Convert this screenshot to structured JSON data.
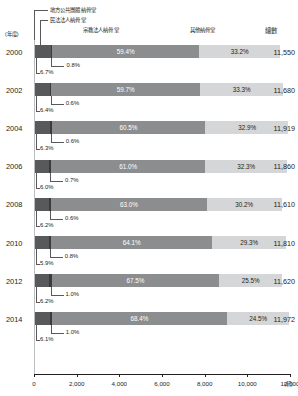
{
  "axis": {
    "year_axis_label": "(年度)",
    "unit_label": "(軒)",
    "x_ticks": [
      "0",
      "2,000",
      "4,000",
      "6,000",
      "8,000",
      "10,000",
      "12,000"
    ],
    "x_min": 0,
    "x_max": 12000
  },
  "legend": [
    {
      "label": "地方公共團體納骨堂",
      "color": "#58595b",
      "key": "local-government"
    },
    {
      "label": "民法法人納骨堂",
      "color": "#3b3b3d",
      "key": "civil-law-corporation"
    },
    {
      "label": "宗教法人納骨堂",
      "color": "#8c8d8f",
      "key": "religious-corporation"
    },
    {
      "label": "其他納骨堂",
      "color": "#d5d6d8",
      "key": "other"
    }
  ],
  "headers": {
    "total": "總數"
  },
  "chart_data": {
    "type": "bar",
    "title": "",
    "xlabel": "(軒)",
    "ylabel": "(年度)",
    "xlim": [
      0,
      12000
    ],
    "orientation": "horizontal",
    "stacked": true,
    "stack_mode": "percent-of-total",
    "grid": false,
    "legend_position": "top",
    "categories": [
      "2000",
      "2002",
      "2004",
      "2006",
      "2008",
      "2010",
      "2012",
      "2014"
    ],
    "series": [
      {
        "name": "地方公共團體納骨堂",
        "values": [
          6.7,
          6.4,
          6.3,
          6.0,
          6.2,
          5.9,
          6.2,
          6.1
        ]
      },
      {
        "name": "民法法人納骨堂",
        "values": [
          0.8,
          0.6,
          0.6,
          0.7,
          0.6,
          0.8,
          1.0,
          1.0
        ]
      },
      {
        "name": "宗教法人納骨堂",
        "values": [
          59.4,
          59.7,
          60.5,
          61.0,
          63.0,
          64.1,
          67.5,
          68.4
        ]
      },
      {
        "name": "其他納骨堂",
        "values": [
          33.2,
          33.3,
          32.9,
          32.3,
          30.2,
          29.3,
          25.5,
          24.5
        ]
      }
    ],
    "totals": [
      11550,
      11680,
      11919,
      11860,
      11610,
      11810,
      11620,
      11972
    ]
  },
  "rows": [
    {
      "year": "2000",
      "p1": "6.7%",
      "p2": "0.8%",
      "p3": "59.4%",
      "p4": "33.2%",
      "total": "11,550",
      "t": 11550
    },
    {
      "year": "2002",
      "p1": "6.4%",
      "p2": "0.6%",
      "p3": "59.7%",
      "p4": "33.3%",
      "total": "11,680",
      "t": 11680
    },
    {
      "year": "2004",
      "p1": "6.3%",
      "p2": "0.6%",
      "p3": "60.5%",
      "p4": "32.9%",
      "total": "11,919",
      "t": 11919
    },
    {
      "year": "2006",
      "p1": "6.0%",
      "p2": "0.7%",
      "p3": "61.0%",
      "p4": "32.3%",
      "total": "11,860",
      "t": 11860
    },
    {
      "year": "2008",
      "p1": "6.2%",
      "p2": "0.6%",
      "p3": "63.0%",
      "p4": "30.2%",
      "total": "11,610",
      "t": 11610
    },
    {
      "year": "2010",
      "p1": "5.9%",
      "p2": "0.8%",
      "p3": "64.1%",
      "p4": "29.3%",
      "total": "11,810",
      "t": 11810
    },
    {
      "year": "2012",
      "p1": "6.2%",
      "p2": "1.0%",
      "p3": "67.5%",
      "p4": "25.5%",
      "total": "11,620",
      "t": 11620
    },
    {
      "year": "2014",
      "p1": "6.1%",
      "p2": "1.0%",
      "p3": "68.4%",
      "p4": "24.5%",
      "total": "11,972",
      "t": 11972
    }
  ]
}
